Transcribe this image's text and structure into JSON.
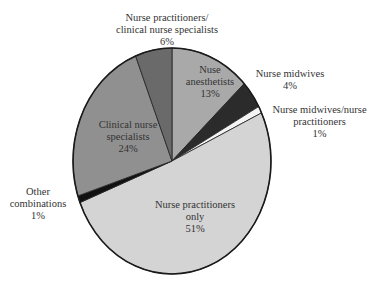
{
  "chart_data": {
    "type": "pie",
    "title": "",
    "center": [
      172,
      161
    ],
    "radius": [
      99,
      113
    ],
    "start_angle_deg": 0,
    "direction": "clockwise",
    "slices": [
      {
        "label": "Nuse anesthetists",
        "value": 13,
        "display": "13%",
        "color": "#a9a9a9"
      },
      {
        "label": "Nurse midwives",
        "value": 4,
        "display": "4%",
        "color": "#2b2b2b"
      },
      {
        "label": "Nurse midwives/nurse practitioners",
        "value": 1,
        "display": "1%",
        "color": "#f4f4f4"
      },
      {
        "label": "Nurse practitioners only",
        "value": 51,
        "display": "51%",
        "color": "#d4d4d4"
      },
      {
        "label": "Other combinations",
        "value": 1,
        "display": "1%",
        "color": "#111111"
      },
      {
        "label": "Clinical nurse specialists",
        "value": 24,
        "display": "24%",
        "color": "#909090"
      },
      {
        "label": "Nurse practitioners/ clinical nurse specialists",
        "value": 6,
        "display": "6%",
        "color": "#6a6a6a"
      }
    ]
  },
  "labels": {
    "np_cns": {
      "line1": "Nurse practitioners/",
      "line2": "clinical nurse specialists",
      "pct": "6%"
    },
    "na": {
      "line1": "Nuse",
      "line2": "anesthetists",
      "pct": "13%"
    },
    "nm": {
      "line1": "Nurse midwives",
      "pct": "4%"
    },
    "nm_np": {
      "line1": "Nurse midwives/nurse",
      "line2": "practitioners",
      "pct": "1%"
    },
    "cns": {
      "line1": "Clinical nurse",
      "line2": "specialists",
      "pct": "24%"
    },
    "other": {
      "line1": "Other",
      "line2": "combinations",
      "pct": "1%"
    },
    "np_only": {
      "line1": "Nurse practitioners",
      "line2": "only",
      "pct": "51%"
    }
  }
}
